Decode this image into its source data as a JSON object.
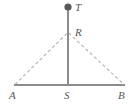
{
  "figure": {
    "type": "geometry-diagram",
    "colors": {
      "background": "#ffffff",
      "solid_line": "#8c8c8c",
      "dashed_line": "#b0b0b0",
      "label_text": "#595959",
      "marker_fill": "#595959"
    },
    "points": [
      {
        "id": "T",
        "label": "T",
        "x": 68,
        "y": 7,
        "marker": "filled-dot",
        "marker_radius": 3.6
      },
      {
        "id": "R",
        "label": "R",
        "x": 68,
        "y": 33,
        "marker": "none"
      },
      {
        "id": "A",
        "label": "A",
        "x": 14,
        "y": 85,
        "marker": "none"
      },
      {
        "id": "S",
        "label": "S",
        "x": 68,
        "y": 85,
        "marker": "none"
      },
      {
        "id": "B",
        "label": "B",
        "x": 125,
        "y": 85,
        "marker": "none"
      }
    ],
    "segments": [
      {
        "id": "TS",
        "from": "T",
        "to": "S",
        "style": "solid"
      },
      {
        "id": "AB",
        "from": "A",
        "to": "B",
        "style": "solid"
      },
      {
        "id": "AR",
        "from": "A",
        "to": "R",
        "style": "dashed"
      },
      {
        "id": "RB",
        "from": "R",
        "to": "B",
        "style": "dashed"
      }
    ],
    "labels": {
      "T": "T",
      "R": "R",
      "A": "A",
      "S": "S",
      "B": "B"
    }
  }
}
